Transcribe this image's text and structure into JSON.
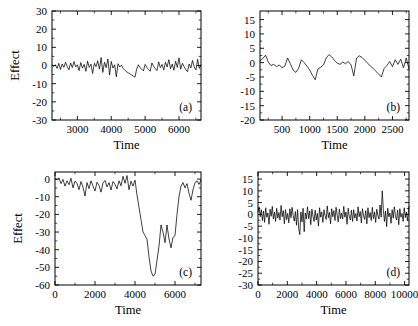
{
  "figure": {
    "panel_count": 4,
    "background": "#ffffff",
    "line_color": "#000000"
  },
  "chart_data": [
    {
      "id": "a",
      "type": "line",
      "panel_label": "(a)",
      "title": "",
      "xlabel": "Time",
      "ylabel": "Effect",
      "xlim": [
        2250,
        6650
      ],
      "ylim": [
        -30,
        30
      ],
      "xticks": [
        3000,
        4000,
        5000,
        6000
      ],
      "yticks": [
        30,
        20,
        10,
        0,
        -10,
        -20,
        -30
      ],
      "xticklabels": [
        "3000",
        "4000",
        "5000",
        "6000"
      ],
      "yticklabels": [
        "30",
        "20",
        "10",
        "0",
        "-10",
        "-20",
        "-30"
      ],
      "grid": false,
      "legend": "none",
      "x": [
        2250,
        2300,
        2350,
        2400,
        2450,
        2500,
        2550,
        2600,
        2650,
        2700,
        2750,
        2800,
        2850,
        2900,
        2950,
        3000,
        3050,
        3100,
        3150,
        3200,
        3250,
        3300,
        3350,
        3400,
        3450,
        3500,
        3550,
        3600,
        3650,
        3700,
        3750,
        3800,
        3850,
        3900,
        3950,
        4000,
        4050,
        4100,
        4150,
        4200,
        4250,
        4300,
        4350,
        4400,
        4450,
        4500,
        4550,
        4600,
        4650,
        4700,
        4750,
        4800,
        4850,
        4900,
        4950,
        5000,
        5050,
        5100,
        5150,
        5200,
        5250,
        5300,
        5350,
        5400,
        5450,
        5500,
        5550,
        5600,
        5650,
        5700,
        5750,
        5800,
        5850,
        5900,
        5950,
        6000,
        6050,
        6100,
        6150,
        6200,
        6250,
        6300,
        6350,
        6400,
        6450,
        6500,
        6550,
        6600,
        6650
      ],
      "y": [
        0.2,
        -0.4,
        0.4,
        -1.6,
        1.2,
        -2.2,
        0.8,
        -1.0,
        1.8,
        -0.6,
        -2.4,
        1.4,
        -1.2,
        2.2,
        -0.8,
        0.4,
        -2.8,
        1.6,
        -1.4,
        0.6,
        -3.2,
        2.4,
        -1.0,
        0.8,
        -4.4,
        1.2,
        -0.6,
        2.6,
        -2.0,
        4.4,
        -3.8,
        1.8,
        -1.2,
        3.6,
        -5.2,
        2.2,
        -1.4,
        0.4,
        -6.2,
        1.0,
        -0.8,
        0.2,
        -1.6,
        -2.6,
        -3.4,
        -4.0,
        -4.6,
        -5.2,
        -5.8,
        -6.4,
        -2.0,
        0.4,
        -1.2,
        -2.0,
        -3.0,
        0.6,
        -1.0,
        -2.2,
        -3.2,
        1.4,
        -0.4,
        -1.6,
        -2.8,
        2.0,
        -1.2,
        0.6,
        -2.4,
        1.8,
        -0.8,
        3.2,
        -1.8,
        0.8,
        -2.6,
        2.4,
        -1.0,
        4.2,
        -2.0,
        1.2,
        -0.6,
        -2.2,
        -3.4,
        0.8,
        -1.4,
        2.8,
        -0.8,
        -2.4,
        3.4,
        -1.6,
        0.4
      ]
    },
    {
      "id": "b",
      "type": "line",
      "panel_label": "(b)",
      "title": "",
      "xlabel": "Time",
      "ylabel": "",
      "xlim": [
        100,
        2800
      ],
      "ylim": [
        -20,
        18
      ],
      "xticks": [
        500,
        1000,
        1500,
        2000,
        2500
      ],
      "yticks": [
        15,
        10,
        5,
        0,
        -5,
        -10,
        -15,
        -20
      ],
      "xticklabels": [
        "500",
        "1000",
        "1500",
        "2000",
        "2500"
      ],
      "yticklabels": [
        "15",
        "10",
        "5",
        "0",
        "-5",
        "-10",
        "-15",
        "-20"
      ],
      "grid": false,
      "legend": "none",
      "x": [
        100,
        150,
        200,
        250,
        300,
        350,
        400,
        450,
        500,
        550,
        600,
        650,
        700,
        750,
        800,
        850,
        900,
        950,
        1000,
        1050,
        1100,
        1150,
        1200,
        1250,
        1300,
        1350,
        1400,
        1450,
        1500,
        1550,
        1600,
        1650,
        1700,
        1750,
        1800,
        1850,
        1900,
        1950,
        2000,
        2050,
        2100,
        2150,
        2200,
        2250,
        2300,
        2350,
        2400,
        2450,
        2500,
        2550,
        2600,
        2650,
        2700,
        2750,
        2800
      ],
      "y": [
        0.6,
        1.4,
        2.6,
        0.2,
        -1.0,
        -0.6,
        -1.4,
        -0.8,
        -1.8,
        -1.2,
        1.6,
        -0.4,
        -2.6,
        -3.4,
        -2.0,
        1.0,
        0.0,
        -1.2,
        -2.6,
        -4.4,
        -6.0,
        -2.2,
        -1.6,
        -0.8,
        1.6,
        2.8,
        2.0,
        0.8,
        -0.2,
        -0.6,
        0.2,
        -0.4,
        0.4,
        -0.8,
        -4.6,
        1.6,
        2.4,
        1.8,
        0.8,
        -0.2,
        -1.2,
        -2.0,
        -3.0,
        -4.0,
        -5.0,
        -2.0,
        -1.0,
        0.4,
        -1.4,
        1.0,
        -0.6,
        1.2,
        -1.8,
        1.6,
        -2.2
      ]
    },
    {
      "id": "c",
      "type": "line",
      "panel_label": "(c)",
      "title": "",
      "xlabel": "Time",
      "ylabel": "Effect",
      "xlim": [
        0,
        7300
      ],
      "ylim": [
        -60,
        4
      ],
      "xticks": [
        0,
        2000,
        4000,
        6000
      ],
      "yticks": [
        0,
        -10,
        -20,
        -30,
        -40,
        -50,
        -60
      ],
      "xticklabels": [
        "0",
        "2000",
        "4000",
        "6000"
      ],
      "yticklabels": [
        "0",
        "-10",
        "-20",
        "-30",
        "-40",
        "-50",
        "-60"
      ],
      "grid": false,
      "legend": "none",
      "x": [
        0,
        100,
        200,
        300,
        400,
        500,
        600,
        700,
        800,
        900,
        1000,
        1100,
        1200,
        1300,
        1400,
        1500,
        1600,
        1700,
        1800,
        1900,
        2000,
        2100,
        2200,
        2300,
        2400,
        2500,
        2600,
        2700,
        2800,
        2900,
        3000,
        3100,
        3200,
        3300,
        3400,
        3500,
        3600,
        3700,
        3800,
        3900,
        4000,
        4100,
        4200,
        4300,
        4400,
        4500,
        4600,
        4700,
        4800,
        4900,
        5000,
        5100,
        5200,
        5300,
        5400,
        5500,
        5600,
        5700,
        5800,
        5900,
        6000,
        6100,
        6200,
        6300,
        6400,
        6500,
        6600,
        6700,
        6800,
        6900,
        7000,
        7100,
        7200,
        7300
      ],
      "y": [
        0.0,
        -0.4,
        0.6,
        -2.6,
        -0.2,
        -4.0,
        -1.0,
        -3.2,
        0.4,
        -5.0,
        -1.2,
        -2.4,
        -6.0,
        -1.4,
        -4.6,
        -9.6,
        -2.0,
        -5.4,
        -1.0,
        -4.0,
        -6.8,
        -1.8,
        -3.6,
        -7.4,
        -2.2,
        -0.8,
        -4.4,
        -2.0,
        -6.2,
        -1.4,
        -3.0,
        -5.6,
        -1.0,
        -3.8,
        1.6,
        -2.4,
        2.0,
        -6.0,
        -1.2,
        -4.0,
        -0.6,
        -9.0,
        -16.0,
        -23.0,
        -30.0,
        -32.0,
        -34.0,
        -44.0,
        -52.0,
        -55.0,
        -54.0,
        -46.0,
        -38.0,
        -26.0,
        -30.0,
        -36.0,
        -26.0,
        -34.0,
        -39.0,
        -33.0,
        -32.0,
        -20.0,
        -10.0,
        -4.0,
        -2.0,
        -5.0,
        -2.6,
        -8.0,
        -12.0,
        -6.0,
        -2.0,
        -1.0,
        -3.0,
        -0.6
      ]
    },
    {
      "id": "d",
      "type": "line",
      "panel_label": "(d)",
      "title": "",
      "xlabel": "Time",
      "ylabel": "",
      "xlim": [
        0,
        10300
      ],
      "ylim": [
        -30,
        18
      ],
      "xticks": [
        0,
        2000,
        4000,
        6000,
        8000,
        10000
      ],
      "yticks": [
        15,
        10,
        5,
        0,
        -5,
        -10,
        -15,
        -20,
        -25,
        -30
      ],
      "xticklabels": [
        "0",
        "2000",
        "4000",
        "6000",
        "8000",
        "10000"
      ],
      "yticklabels": [
        "15",
        "10",
        "5",
        "0",
        "-5",
        "-10",
        "-15",
        "-20",
        "-25",
        "-30"
      ],
      "grid": false,
      "legend": "none",
      "x": [
        0,
        75,
        150,
        225,
        300,
        375,
        450,
        525,
        600,
        675,
        750,
        825,
        900,
        975,
        1050,
        1125,
        1200,
        1275,
        1350,
        1425,
        1500,
        1575,
        1650,
        1725,
        1800,
        1875,
        1950,
        2025,
        2100,
        2175,
        2250,
        2325,
        2400,
        2475,
        2550,
        2625,
        2700,
        2775,
        2850,
        2925,
        3000,
        3075,
        3150,
        3225,
        3300,
        3375,
        3450,
        3525,
        3600,
        3675,
        3750,
        3825,
        3900,
        3975,
        4050,
        4125,
        4200,
        4275,
        4350,
        4425,
        4500,
        4575,
        4650,
        4725,
        4800,
        4875,
        4950,
        5025,
        5100,
        5175,
        5250,
        5325,
        5400,
        5475,
        5550,
        5625,
        5700,
        5775,
        5850,
        5925,
        6000,
        6075,
        6150,
        6225,
        6300,
        6375,
        6450,
        6525,
        6600,
        6675,
        6750,
        6825,
        6900,
        6975,
        7050,
        7125,
        7200,
        7275,
        7350,
        7425,
        7500,
        7575,
        7650,
        7725,
        7800,
        7875,
        7950,
        8025,
        8100,
        8175,
        8250,
        8325,
        8400,
        8475,
        8550,
        8625,
        8700,
        8775,
        8850,
        8925,
        9000,
        9075,
        9150,
        9225,
        9300,
        9375,
        9450,
        9525,
        9600,
        9675,
        9750,
        9825,
        9900,
        9975,
        10050,
        10125,
        10200,
        10300
      ],
      "y": [
        1.0,
        3.2,
        -1.0,
        2.0,
        -2.6,
        1.4,
        -3.4,
        2.8,
        -1.2,
        0.6,
        -4.2,
        2.2,
        -0.8,
        3.4,
        -2.0,
        1.0,
        -3.0,
        2.6,
        -1.6,
        0.8,
        -2.4,
        3.8,
        -1.0,
        1.6,
        -4.0,
        2.0,
        -2.2,
        0.4,
        -3.6,
        2.4,
        -1.4,
        3.0,
        -0.6,
        -2.8,
        1.2,
        -4.6,
        2.0,
        -6.0,
        -8.6,
        1.0,
        -3.2,
        2.6,
        -7.4,
        0.6,
        -2.0,
        3.2,
        -1.8,
        1.4,
        -4.4,
        2.2,
        -0.8,
        -3.0,
        1.8,
        -2.4,
        0.4,
        -5.0,
        2.8,
        -1.2,
        1.0,
        -3.4,
        2.0,
        -0.6,
        -2.2,
        3.6,
        -1.4,
        0.8,
        -4.0,
        2.4,
        -1.0,
        1.6,
        -2.6,
        3.0,
        -0.4,
        -3.2,
        2.2,
        -1.8,
        0.6,
        -2.0,
        3.4,
        -1.2,
        1.0,
        -4.2,
        2.6,
        -0.8,
        -2.4,
        1.8,
        -3.0,
        2.0,
        -1.6,
        0.4,
        -2.8,
        3.2,
        -1.0,
        1.2,
        -3.6,
        2.4,
        -0.6,
        -2.2,
        1.6,
        -4.0,
        2.8,
        -1.4,
        0.8,
        -2.6,
        3.0,
        -1.8,
        1.0,
        -3.4,
        2.2,
        -0.4,
        -2.0,
        4.0,
        -1.2,
        10.0,
        2.0,
        -3.0,
        1.4,
        -5.2,
        2.6,
        -1.0,
        0.6,
        -3.8,
        2.0,
        -1.6,
        3.2,
        -0.8,
        -2.4,
        1.8,
        -4.4,
        2.4,
        -1.2,
        0.4,
        -3.0,
        2.8,
        -1.4,
        1.0,
        -2.6,
        3.4,
        -1.0,
        0.2,
        -2.0,
        1.2
      ]
    }
  ]
}
